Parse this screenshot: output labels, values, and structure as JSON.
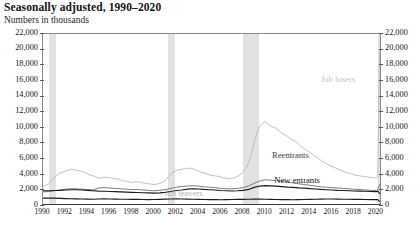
{
  "header": {
    "title": "Seasonally adjusted, 1990–2020",
    "subtitle": "Numbers in thousands"
  },
  "chart_data": {
    "type": "line",
    "title": "Seasonally adjusted, 1990–2020",
    "subtitle": "Numbers in thousands",
    "xlabel": "",
    "ylabel": "Numbers in thousands",
    "ylim": [
      0,
      22000
    ],
    "ytick_step": 2000,
    "ytick_labels": [
      "0",
      "2,000",
      "4,000",
      "6,000",
      "8,000",
      "10,000",
      "12,000",
      "14,000",
      "16,000",
      "18,000",
      "20,000",
      "22,000"
    ],
    "y_axis_mirrored": true,
    "xlim": [
      1990,
      2020.5
    ],
    "xtick_labels": [
      "1990",
      "1992",
      "1994",
      "1996",
      "1998",
      "2000",
      "2002",
      "2004",
      "2006",
      "2008",
      "2010",
      "2012",
      "2014",
      "2016",
      "2018",
      "2020"
    ],
    "grid": false,
    "legend_position": "inline-annotations",
    "frequency": "monthly",
    "annotations": [
      {
        "text": "Job losers",
        "x": 2015.1,
        "y": 16100,
        "color": "#c2c2c2"
      },
      {
        "text": "Reentrants",
        "x": 2010.7,
        "y": 6450,
        "color": "#3d3d3d"
      },
      {
        "text": "New entrants",
        "x": 2010.9,
        "y": 3250,
        "color": "#151515"
      },
      {
        "text": "Job leavers",
        "x": 2001.0,
        "y": 1500,
        "color": "#b4b4b4"
      }
    ],
    "recession_bands": [
      {
        "start": 1990.54,
        "end": 1991.21
      },
      {
        "start": 2001.21,
        "end": 2001.88
      },
      {
        "start": 2007.96,
        "end": 2009.46
      },
      {
        "start": 2020.12,
        "end": 2020.37
      }
    ],
    "recession_band_color": "#e2e2e2",
    "series": [
      {
        "name": "Job losers",
        "color": "#b9b9b9",
        "width": 0.9,
        "x": [
          1990.0,
          1990.25,
          1990.5,
          1990.75,
          1991.0,
          1991.25,
          1991.5,
          1991.75,
          1992.0,
          1992.25,
          1992.5,
          1992.75,
          1993.0,
          1993.25,
          1993.5,
          1993.75,
          1994.0,
          1994.25,
          1994.5,
          1994.75,
          1995.0,
          1995.25,
          1995.5,
          1995.75,
          1996.0,
          1996.25,
          1996.5,
          1996.75,
          1997.0,
          1997.25,
          1997.5,
          1997.75,
          1998.0,
          1998.25,
          1998.5,
          1998.75,
          1999.0,
          1999.25,
          1999.5,
          1999.75,
          2000.0,
          2000.25,
          2000.5,
          2000.75,
          2001.0,
          2001.25,
          2001.5,
          2001.75,
          2002.0,
          2002.25,
          2002.5,
          2002.75,
          2003.0,
          2003.25,
          2003.5,
          2003.75,
          2004.0,
          2004.25,
          2004.5,
          2004.75,
          2005.0,
          2005.25,
          2005.5,
          2005.75,
          2006.0,
          2006.25,
          2006.5,
          2006.75,
          2007.0,
          2007.25,
          2007.5,
          2007.75,
          2008.0,
          2008.25,
          2008.5,
          2008.75,
          2009.0,
          2009.25,
          2009.5,
          2009.75,
          2010.0,
          2010.25,
          2010.5,
          2010.75,
          2011.0,
          2011.25,
          2011.5,
          2011.75,
          2012.0,
          2012.25,
          2012.5,
          2012.75,
          2013.0,
          2013.25,
          2013.5,
          2013.75,
          2014.0,
          2014.25,
          2014.5,
          2014.75,
          2015.0,
          2015.25,
          2015.5,
          2015.75,
          2016.0,
          2016.25,
          2016.5,
          2016.75,
          2017.0,
          2017.25,
          2017.5,
          2017.75,
          2018.0,
          2018.25,
          2018.5,
          2018.75,
          2019.0,
          2019.25,
          2019.5,
          2019.75,
          2020.0,
          2020.12,
          2020.25,
          2020.33,
          2020.42,
          2020.5
        ],
        "y": [
          2500,
          2620,
          2800,
          3150,
          3600,
          3950,
          4200,
          4300,
          4450,
          4600,
          4700,
          4650,
          4550,
          4500,
          4400,
          4300,
          4100,
          3950,
          3850,
          3750,
          3550,
          3600,
          3700,
          3650,
          3600,
          3550,
          3500,
          3450,
          3300,
          3200,
          3150,
          3100,
          3000,
          3050,
          3100,
          3050,
          2950,
          2900,
          2850,
          2800,
          2750,
          2800,
          2900,
          3050,
          3300,
          3700,
          4050,
          4350,
          4550,
          4650,
          4700,
          4750,
          4800,
          4850,
          4750,
          4600,
          4450,
          4300,
          4200,
          4100,
          3950,
          3900,
          3850,
          3800,
          3700,
          3600,
          3550,
          3500,
          3550,
          3650,
          3800,
          4000,
          4350,
          4850,
          5500,
          6600,
          8100,
          9300,
          10200,
          10550,
          10800,
          10450,
          10200,
          10100,
          9900,
          9600,
          9300,
          9100,
          8900,
          8600,
          8400,
          8200,
          7900,
          7600,
          7350,
          7100,
          6850,
          6600,
          6350,
          6100,
          5850,
          5600,
          5400,
          5200,
          5050,
          4900,
          4750,
          4600,
          4450,
          4300,
          4200,
          4100,
          4000,
          3900,
          3850,
          3800,
          3750,
          3700,
          3650,
          3600,
          3550,
          3700,
          17900,
          19900,
          18600,
          15200
        ]
      },
      {
        "name": "Reentrants",
        "color": "#6e6e6e",
        "width": 0.9,
        "x": [
          1990.0,
          1990.5,
          1991.0,
          1991.5,
          1992.0,
          1992.5,
          1993.0,
          1993.5,
          1994.0,
          1994.5,
          1995.0,
          1995.5,
          1996.0,
          1996.5,
          1997.0,
          1997.5,
          1998.0,
          1998.5,
          1999.0,
          1999.5,
          2000.0,
          2000.5,
          2001.0,
          2001.5,
          2002.0,
          2002.5,
          2003.0,
          2003.5,
          2004.0,
          2004.5,
          2005.0,
          2005.5,
          2006.0,
          2006.5,
          2007.0,
          2007.5,
          2008.0,
          2008.5,
          2009.0,
          2009.5,
          2010.0,
          2010.5,
          2011.0,
          2011.5,
          2012.0,
          2012.5,
          2013.0,
          2013.5,
          2014.0,
          2014.5,
          2015.0,
          2015.5,
          2016.0,
          2016.5,
          2017.0,
          2017.5,
          2018.0,
          2018.5,
          2019.0,
          2019.5,
          2020.0,
          2020.12,
          2020.25,
          2020.33,
          2020.42,
          2020.5
        ],
        "y": [
          1800,
          1850,
          1950,
          2050,
          2150,
          2200,
          2200,
          2150,
          2100,
          2050,
          2300,
          2350,
          2300,
          2250,
          2200,
          2150,
          2100,
          2100,
          2050,
          2000,
          1950,
          2000,
          2100,
          2250,
          2400,
          2500,
          2550,
          2600,
          2550,
          2450,
          2400,
          2350,
          2250,
          2200,
          2200,
          2250,
          2350,
          2550,
          2900,
          3200,
          3350,
          3300,
          3250,
          3150,
          3050,
          2950,
          2850,
          2750,
          2650,
          2550,
          2450,
          2400,
          2350,
          2300,
          2250,
          2200,
          2150,
          2100,
          2050,
          2000,
          1980,
          2050,
          2600,
          2800,
          2750,
          2600
        ]
      },
      {
        "name": "Job leavers",
        "color": "#1c1c1c",
        "width": 1.15,
        "x": [
          1990.0,
          1990.5,
          1991.0,
          1991.5,
          1992.0,
          1992.5,
          1993.0,
          1993.5,
          1994.0,
          1994.5,
          1995.0,
          1995.5,
          1996.0,
          1996.5,
          1997.0,
          1997.5,
          1998.0,
          1998.5,
          1999.0,
          1999.5,
          2000.0,
          2000.5,
          2001.0,
          2001.5,
          2002.0,
          2002.5,
          2003.0,
          2003.5,
          2004.0,
          2004.5,
          2005.0,
          2005.5,
          2006.0,
          2006.5,
          2007.0,
          2007.5,
          2008.0,
          2008.5,
          2009.0,
          2009.5,
          2010.0,
          2010.5,
          2011.0,
          2011.5,
          2012.0,
          2012.5,
          2013.0,
          2013.5,
          2014.0,
          2014.5,
          2015.0,
          2015.5,
          2016.0,
          2016.5,
          2017.0,
          2017.5,
          2018.0,
          2018.5,
          2019.0,
          2019.5,
          2020.0,
          2020.12,
          2020.25,
          2020.33,
          2020.42,
          2020.5
        ],
        "y": [
          1000,
          1020,
          1000,
          980,
          950,
          930,
          920,
          900,
          880,
          870,
          900,
          920,
          900,
          880,
          870,
          860,
          850,
          840,
          830,
          820,
          830,
          850,
          880,
          900,
          920,
          900,
          880,
          870,
          850,
          830,
          820,
          810,
          800,
          820,
          830,
          840,
          850,
          870,
          880,
          900,
          870,
          850,
          830,
          820,
          810,
          800,
          820,
          830,
          850,
          860,
          880,
          900,
          900,
          880,
          870,
          860,
          850,
          840,
          830,
          820,
          810,
          830,
          620,
          600,
          680,
          760
        ]
      },
      {
        "name": "New entrants",
        "color": "#1c1c1c",
        "width": 1.15,
        "x": [
          1990.0,
          1990.5,
          1991.0,
          1991.5,
          1992.0,
          1992.5,
          1993.0,
          1993.5,
          1994.0,
          1994.5,
          1995.0,
          1995.5,
          1996.0,
          1996.5,
          1997.0,
          1997.5,
          1998.0,
          1998.5,
          1999.0,
          1999.5,
          2000.0,
          2000.5,
          2001.0,
          2001.5,
          2002.0,
          2002.5,
          2003.0,
          2003.5,
          2004.0,
          2004.5,
          2005.0,
          2005.5,
          2006.0,
          2006.5,
          2007.0,
          2007.5,
          2008.0,
          2008.5,
          2009.0,
          2009.5,
          2010.0,
          2010.5,
          2011.0,
          2011.5,
          2012.0,
          2012.5,
          2013.0,
          2013.5,
          2014.0,
          2014.5,
          2015.0,
          2015.5,
          2016.0,
          2016.5,
          2017.0,
          2017.5,
          2018.0,
          2018.5,
          2019.0,
          2019.5,
          2020.0,
          2020.12,
          2020.25,
          2020.33,
          2020.42,
          2020.5
        ],
        "y": [
          1950,
          1950,
          1980,
          2000,
          2050,
          2080,
          2080,
          2050,
          2000,
          1950,
          1900,
          1880,
          1850,
          1830,
          1800,
          1780,
          1750,
          1730,
          1700,
          1680,
          1650,
          1680,
          1750,
          1850,
          1980,
          2050,
          2150,
          2200,
          2180,
          2120,
          2080,
          2050,
          1980,
          1950,
          1920,
          1950,
          2000,
          2120,
          2380,
          2550,
          2600,
          2580,
          2550,
          2480,
          2420,
          2380,
          2320,
          2280,
          2220,
          2180,
          2120,
          2080,
          2050,
          2000,
          1980,
          1950,
          1920,
          1900,
          1880,
          1850,
          1830,
          1900,
          1650,
          1600,
          1700,
          1820
        ]
      }
    ]
  }
}
